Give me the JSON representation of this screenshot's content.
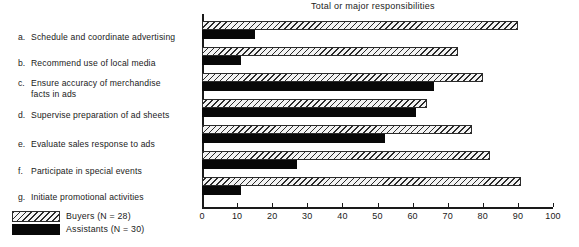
{
  "chart_data": {
    "type": "bar",
    "orientation": "horizontal",
    "title": "Total or major responsibilities",
    "xlabel": "",
    "ylabel": "",
    "xlim": [
      0,
      100
    ],
    "xticks": [
      0,
      10,
      20,
      30,
      40,
      50,
      60,
      70,
      80,
      90,
      100
    ],
    "grid": false,
    "legend_position": "bottom-left",
    "categories": [
      "Schedule and coordinate advertising",
      "Recommend use of local media",
      "Ensure accuracy of merchandise facts in ads",
      "Supervise preparation of ad sheets",
      "Evaluate sales response to ads",
      "Participate in special events",
      "Initiate promotional activities"
    ],
    "category_letters": [
      "a.",
      "b.",
      "c.",
      "d.",
      "e.",
      "f.",
      "g."
    ],
    "series": [
      {
        "name": "Buyers (N = 28)",
        "short_name": "Buyers",
        "n": 28,
        "pattern": "diagonal-hatch",
        "color": "#2b2b2b",
        "values": [
          90,
          73,
          80,
          64,
          77,
          82,
          91
        ]
      },
      {
        "name": "Assistants (N = 30)",
        "short_name": "Assistants",
        "n": 30,
        "pattern": "solid",
        "color": "#080808",
        "values": [
          15,
          11,
          66,
          61,
          52,
          27,
          11
        ]
      }
    ]
  },
  "legend": {
    "items": [
      {
        "label": "Buyers (N = 28)",
        "swatch": "hatched"
      },
      {
        "label": "Assistants (N = 30)",
        "swatch": "solid-black"
      }
    ]
  }
}
